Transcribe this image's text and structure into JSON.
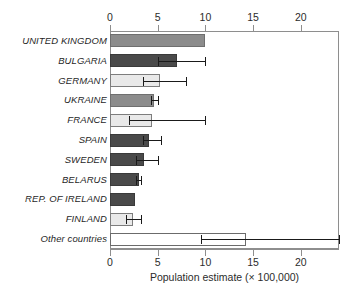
{
  "chart_data": {
    "type": "bar",
    "orientation": "horizontal",
    "title": "",
    "xlabel": "Population estimate (× 100,000)",
    "ylabel": "",
    "xlim": [
      0,
      24
    ],
    "grid": false,
    "legend": "none",
    "axes": {
      "top_axis": true,
      "bottom_axis": true,
      "tick_values": [
        0,
        5,
        10,
        15,
        20
      ],
      "tick_labels": [
        "0",
        "5",
        "10",
        "15",
        "20"
      ]
    },
    "categories": [
      "UNITED KINGDOM",
      "BULGARIA",
      "GERMANY",
      "UKRAINE",
      "FRANCE",
      "SPAIN",
      "SWEDEN",
      "BELARUS",
      "REP. OF IRELAND",
      "FINLAND",
      "Other countries"
    ],
    "values": [
      10.0,
      7.0,
      5.2,
      4.6,
      4.4,
      4.1,
      3.6,
      3.0,
      2.6,
      2.4,
      14.3
    ],
    "error_low": [
      null,
      5.0,
      3.5,
      4.3,
      2.0,
      3.5,
      2.7,
      2.7,
      null,
      1.7,
      9.5
    ],
    "error_high": [
      null,
      10.0,
      8.0,
      5.0,
      10.0,
      5.3,
      5.0,
      3.2,
      null,
      3.2,
      24.0
    ],
    "bar_shades": [
      "medium",
      "dark",
      "light",
      "medium",
      "light",
      "dark",
      "dark",
      "dark",
      "dark",
      "light",
      "white"
    ]
  },
  "colors": {
    "shade_medium": "#8c8c8c",
    "shade_dark": "#4a4a4a",
    "shade_light": "#e9e9e9",
    "shade_white": "#ffffff",
    "axis": "#8e8e8e",
    "error_bar": "#1a1a1a",
    "text": "#1f1f1f"
  }
}
